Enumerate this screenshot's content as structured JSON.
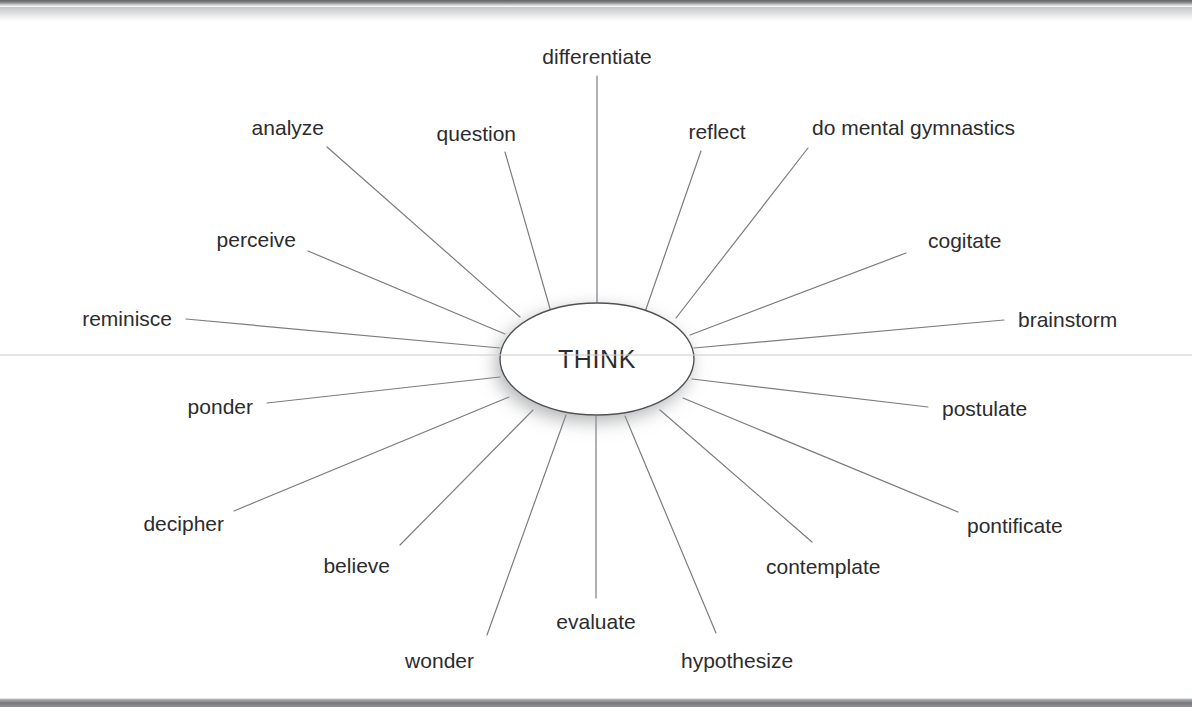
{
  "diagram": {
    "type": "radial-word-web",
    "center": {
      "label": "THINK",
      "cx": 597,
      "cy": 359,
      "rx": 97,
      "ry": 56
    },
    "style": {
      "line_color": "#7a7c80",
      "text_color": "#2c2c2e",
      "ellipse_stroke": "#4f5154",
      "background": "#ffffff",
      "shadow_color": "#b9babc"
    },
    "spokes": [
      {
        "label": "differentiate",
        "anchor": "mid",
        "lx": 597,
        "ly": 56,
        "x1": 597,
        "y1": 76,
        "x2": 597,
        "y2": 303
      },
      {
        "label": "reflect",
        "anchor": "mid",
        "lx": 717,
        "ly": 131,
        "x1": 701,
        "y1": 151,
        "x2": 645,
        "y2": 312
      },
      {
        "label": "do mental gymnastics",
        "anchor": "start",
        "lx": 812,
        "ly": 127,
        "x1": 808,
        "y1": 148,
        "x2": 676,
        "y2": 318
      },
      {
        "label": "cogitate",
        "anchor": "start",
        "lx": 928,
        "ly": 240,
        "x1": 906,
        "y1": 253,
        "x2": 690,
        "y2": 335
      },
      {
        "label": "brainstorm",
        "anchor": "start",
        "lx": 1018,
        "ly": 319,
        "x1": 1004,
        "y1": 320,
        "x2": 694,
        "y2": 348
      },
      {
        "label": "postulate",
        "anchor": "start",
        "lx": 942,
        "ly": 408,
        "x1": 928,
        "y1": 407,
        "x2": 692,
        "y2": 379
      },
      {
        "label": "pontificate",
        "anchor": "start",
        "lx": 967,
        "ly": 525,
        "x1": 958,
        "y1": 512,
        "x2": 683,
        "y2": 398
      },
      {
        "label": "contemplate",
        "anchor": "start",
        "lx": 766,
        "ly": 566,
        "x1": 812,
        "y1": 542,
        "x2": 660,
        "y2": 410
      },
      {
        "label": "hypothesize",
        "anchor": "start",
        "lx": 681,
        "ly": 660,
        "x1": 716,
        "y1": 633,
        "x2": 625,
        "y2": 416
      },
      {
        "label": "evaluate",
        "anchor": "mid",
        "lx": 596,
        "ly": 621,
        "x1": 596,
        "y1": 598,
        "x2": 596,
        "y2": 416
      },
      {
        "label": "wonder",
        "anchor": "end",
        "lx": 474,
        "ly": 660,
        "x1": 487,
        "y1": 635,
        "x2": 566,
        "y2": 415
      },
      {
        "label": "believe",
        "anchor": "end",
        "lx": 390,
        "ly": 565,
        "x1": 400,
        "y1": 545,
        "x2": 533,
        "y2": 410
      },
      {
        "label": "decipher",
        "anchor": "end",
        "lx": 224,
        "ly": 523,
        "x1": 234,
        "y1": 511,
        "x2": 509,
        "y2": 397
      },
      {
        "label": "ponder",
        "anchor": "end",
        "lx": 253,
        "ly": 406,
        "x1": 267,
        "y1": 403,
        "x2": 500,
        "y2": 377
      },
      {
        "label": "reminisce",
        "anchor": "end",
        "lx": 172,
        "ly": 318,
        "x1": 186,
        "y1": 319,
        "x2": 500,
        "y2": 348
      },
      {
        "label": "perceive",
        "anchor": "end",
        "lx": 296,
        "ly": 239,
        "x1": 308,
        "y1": 251,
        "x2": 505,
        "y2": 334
      },
      {
        "label": "analyze",
        "anchor": "end",
        "lx": 324,
        "ly": 127,
        "x1": 327,
        "y1": 147,
        "x2": 520,
        "y2": 317
      },
      {
        "label": "question",
        "anchor": "end",
        "lx": 516,
        "ly": 133,
        "x1": 505,
        "y1": 152,
        "x2": 551,
        "y2": 312
      }
    ]
  }
}
